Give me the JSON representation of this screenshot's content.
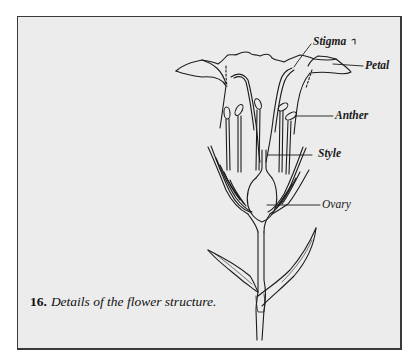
{
  "figure": {
    "number": "16.",
    "caption": "Details of the flower structure.",
    "labels": {
      "stigma": "Stigma",
      "petal": "Petal",
      "anther": "Anther",
      "style": "Style",
      "ovary": "Ovary"
    },
    "colors": {
      "panel_background": "#ececec",
      "border": "#3a3a3a",
      "ink": "#1a1a1a"
    }
  }
}
